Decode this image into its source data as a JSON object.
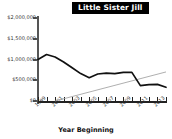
{
  "chart": {
    "title": "Little Sister Jill",
    "xlabel": "Year Beginning",
    "ylabel": ""
  },
  "chart_data": {
    "type": "line",
    "title": "Little Sister Jill",
    "xlabel": "Year Beginning",
    "ylabel": "",
    "ylim": [
      0,
      2000000
    ],
    "xlim": [
      1999,
      2014
    ],
    "grid": false,
    "legend": false,
    "y_ticks": [
      0,
      500000,
      1000000,
      1500000,
      2000000
    ],
    "y_tick_labels": [
      "$0",
      "$500,000",
      "$1,000,000",
      "$1,500,000",
      "$2,000,000"
    ],
    "x_ticks": [
      1999,
      2000,
      2001,
      2002,
      2003,
      2004,
      2005,
      2006,
      2007,
      2008,
      2009,
      2010,
      2011,
      2012,
      2013,
      2014
    ],
    "x_tick_labels": [
      "1999",
      "2001",
      "2003",
      "2005",
      "2007",
      "2009",
      "2011",
      "2013"
    ],
    "x_tick_labels_rotated": true,
    "series": [
      {
        "name": "Little Sister Jill",
        "color": "#111111",
        "x": [
          1999,
          2000,
          2001,
          2002,
          2003,
          2004,
          2005,
          2006,
          2007,
          2008,
          2009,
          2010,
          2011,
          2012,
          2013,
          2014
        ],
        "values": [
          1000000,
          1120000,
          1060000,
          940000,
          800000,
          660000,
          560000,
          650000,
          670000,
          660000,
          690000,
          690000,
          370000,
          395000,
          400000,
          330000
        ]
      },
      {
        "name": "Trend",
        "color": "#9a9a9a",
        "x": [
          2001,
          2014
        ],
        "values": [
          0,
          700000
        ]
      }
    ]
  }
}
